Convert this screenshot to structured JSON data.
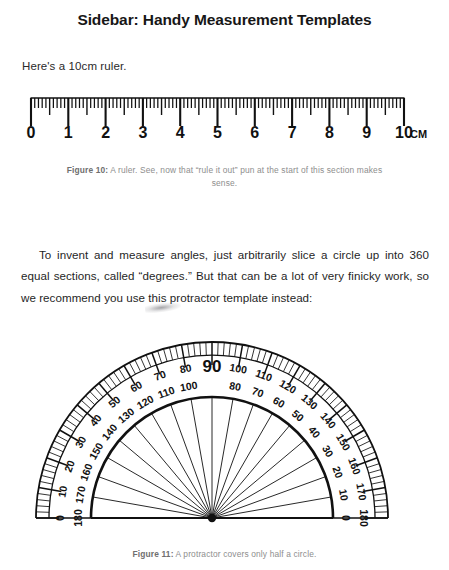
{
  "page": {
    "title": "Sidebar: Handy Measurement Templates",
    "intro": "Here's a 10cm ruler.",
    "paragraph": "To invent and measure angles, just arbitrarily slice a circle up into 360 equal sections, called “degrees.” But that can be a lot of very finicky work, so we recommend you use this protractor template instead:",
    "background_color": "#ffffff",
    "text_color": "#1b1b1b",
    "caption_color": "#8e8e8e"
  },
  "figures": [
    {
      "id": "ruler",
      "caption_label": "Figure 10:",
      "caption_text": "A ruler. See, now that “rule it out” pun at the start of this section makes sense."
    },
    {
      "id": "protractor",
      "caption_label": "Figure 11:",
      "caption_text": "A protractor covers only half a circle."
    }
  ],
  "ruler": {
    "unit_label": "CM",
    "length_cm": 10,
    "minor_divisions_per_cm": 10,
    "labels": [
      "0",
      "1",
      "2",
      "3",
      "4",
      "5",
      "6",
      "7",
      "8",
      "9",
      "10"
    ],
    "stroke_color": "#111111"
  },
  "protractor": {
    "outer_scale_labels": [
      "0",
      "10",
      "20",
      "30",
      "40",
      "50",
      "60",
      "70",
      "80",
      "90",
      "100",
      "110",
      "120",
      "130",
      "140",
      "150",
      "160",
      "170",
      "180"
    ],
    "inner_scale_labels": [
      "180",
      "170",
      "160",
      "150",
      "140",
      "130",
      "120",
      "110",
      "100",
      "90",
      "80",
      "70",
      "60",
      "50",
      "40",
      "30",
      "20",
      "10",
      "0"
    ],
    "emphasized_label": "90",
    "major_step_degrees": 10,
    "tick_step_degrees": 2,
    "spoke_step_degrees": 10,
    "span_degrees": 180,
    "stroke_color": "#111111"
  }
}
